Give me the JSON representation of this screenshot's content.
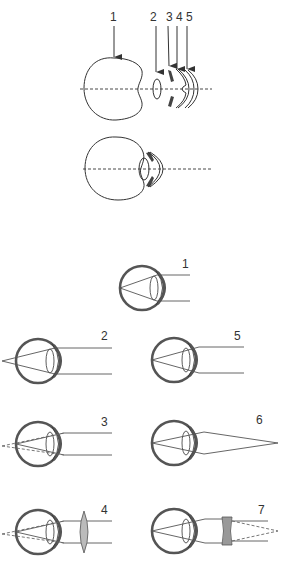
{
  "figure": {
    "exploded_view": {
      "labels": [
        "1",
        "2",
        "3",
        "4",
        "5"
      ],
      "parts": [
        "eyeball",
        "crystalline-lens",
        "iris",
        "cornea-inner",
        "cornea-outer"
      ]
    },
    "assembled_view": {
      "parts": [
        "eyeball",
        "lens",
        "iris",
        "cornea"
      ]
    },
    "ray_diagrams": [
      {
        "label": "1",
        "condition": "normal-vision",
        "focus": "on-retina"
      },
      {
        "label": "2",
        "condition": "hyperopia",
        "focus": "behind-retina"
      },
      {
        "label": "3",
        "condition": "myopia-dashed",
        "focus": "behind-retina-dashed"
      },
      {
        "label": "4",
        "condition": "hyperopia-corrected-convex-lens",
        "focus": "on-retina"
      },
      {
        "label": "5",
        "condition": "normal-vision",
        "focus": "on-retina"
      },
      {
        "label": "6",
        "condition": "myopia",
        "focus": "in-front-of-eye-converging"
      },
      {
        "label": "7",
        "condition": "myopia-corrected-concave-lens",
        "focus": "on-retina"
      }
    ]
  },
  "colors": {
    "ink": "#333333",
    "sclera": "#555555",
    "background": "#ffffff"
  }
}
